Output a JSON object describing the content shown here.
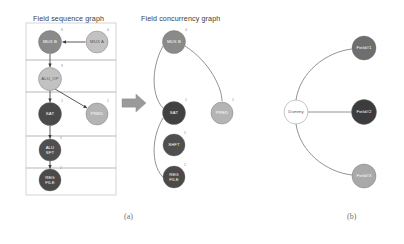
{
  "figure": {
    "panels": [
      {
        "id": "a",
        "caption": "(a)",
        "caption_x": 124,
        "caption_y": 212
      },
      {
        "id": "b",
        "caption": "(b)",
        "caption_x": 347,
        "caption_y": 212
      }
    ]
  },
  "sequence_graph": {
    "title": "Field sequence graph",
    "title_x": 33,
    "title_y": 14,
    "frame": {
      "x": 26,
      "y": 23,
      "width": 90,
      "height": 172
    },
    "bands": [
      {
        "name": "band-1",
        "y": 23,
        "height": 37
      },
      {
        "name": "band-2",
        "y": 60,
        "height": 32
      },
      {
        "name": "band-3",
        "y": 92,
        "height": 44
      },
      {
        "name": "band-4",
        "y": 136,
        "height": 32
      },
      {
        "name": "band-5",
        "y": 168,
        "height": 27
      }
    ],
    "nodes": [
      {
        "id": "mux-b",
        "label": "MUX B",
        "lines": [
          "MUX B"
        ],
        "cx": 50,
        "cy": 42,
        "r": 11.5,
        "fill": "#8a8a8a",
        "label_style": "light",
        "sup": "6",
        "sup_x": 62,
        "sup_y": 31
      },
      {
        "id": "mux-a",
        "label": "MUX A",
        "lines": [
          "MUX A"
        ],
        "cx": 97,
        "cy": 42,
        "r": 11,
        "fill": "#c2c2c2",
        "label_style": "dark",
        "sup": "4",
        "sup_x": 108,
        "sup_y": 31
      },
      {
        "id": "alu-op",
        "label": "ALU_OP",
        "lines": [
          "ALU_OP"
        ],
        "cx": 50,
        "cy": 79,
        "r": 11.5,
        "fill": "#c2c2c2",
        "label_style": "dark",
        "sup": "9",
        "sup_x": 62,
        "sup_y": 67
      },
      {
        "id": "sat",
        "label": "SAT",
        "lines": [
          "SAT"
        ],
        "cx": 50,
        "cy": 114,
        "r": 11.5,
        "fill": "#4a4a4a",
        "label_style": "light",
        "sup": "1",
        "sup_x": 62,
        "sup_y": 102
      },
      {
        "id": "pred",
        "label": "PRED",
        "lines": [
          "PRED"
        ],
        "cx": 97,
        "cy": 114,
        "r": 11,
        "fill": "#b4b4b4",
        "label_style": "light",
        "sup": "1",
        "sup_x": 108,
        "sup_y": 102
      },
      {
        "id": "alu-sft",
        "label": "ALU SFT",
        "lines": [
          "ALU",
          "SFT"
        ],
        "cx": 50,
        "cy": 150,
        "r": 11,
        "fill": "#4f4f4f",
        "label_style": "light",
        "sup": "5",
        "sup_x": 61,
        "sup_y": 139
      },
      {
        "id": "reg-file",
        "label": "REG FILE",
        "lines": [
          "REG",
          "FILE"
        ],
        "cx": 50,
        "cy": 180,
        "r": 11,
        "fill": "#4a4a4a",
        "label_style": "light",
        "sup": "2",
        "sup_x": 61,
        "sup_y": 169
      }
    ],
    "edges": [
      {
        "from": "mux-a",
        "to": "mux-b",
        "path": "M 85.5,42 L 62.5,42"
      },
      {
        "from": "mux-b",
        "to": "alu-op",
        "path": "M 50,53.5 L 50,67"
      },
      {
        "from": "alu-op",
        "to": "sat",
        "path": "M 50,90.5 L 50,102"
      },
      {
        "from": "alu-op",
        "to": "pred",
        "path": "M 55,89 L 87,108"
      },
      {
        "from": "sat",
        "to": "alu-sft",
        "path": "M 50,125.5 L 50,138.5"
      },
      {
        "from": "alu-sft",
        "to": "reg-file",
        "path": "M 50,161 L 50,168.5"
      }
    ]
  },
  "transform_arrow": {
    "name": "transform-arrow",
    "x": 122,
    "y": 94,
    "width": 24,
    "height": 18,
    "fill": "#9a9a9a"
  },
  "concurrency_graph": {
    "title": "Field concurrency graph",
    "title_x": 141,
    "title_y": 14,
    "nodes": [
      {
        "id": "c-mux-b",
        "label": "MUX B",
        "lines": [
          "MUX B"
        ],
        "cx": 174,
        "cy": 42,
        "r": 11.5,
        "fill": "#8a8a8a",
        "label_style": "light",
        "sup": "4",
        "sup_x": 186,
        "sup_y": 31
      },
      {
        "id": "c-sat",
        "label": "SAT",
        "lines": [
          "SAT"
        ],
        "cx": 174,
        "cy": 113,
        "r": 11.5,
        "fill": "#414141",
        "label_style": "light",
        "sup": "1",
        "sup_x": 186,
        "sup_y": 101
      },
      {
        "id": "c-pred",
        "label": "PRED",
        "lines": [
          "PRED"
        ],
        "cx": 222,
        "cy": 113,
        "r": 11,
        "fill": "#b4b4b4",
        "label_style": "light",
        "sup": "1",
        "sup_x": 233,
        "sup_y": 101
      },
      {
        "id": "c-shft",
        "label": "SHFT",
        "lines": [
          "SHFT"
        ],
        "cx": 174,
        "cy": 145,
        "r": 11,
        "fill": "#4f4f4f",
        "label_style": "light",
        "sup": "5",
        "sup_x": 185,
        "sup_y": 134
      },
      {
        "id": "c-reg-file",
        "label": "REG FILE",
        "lines": [
          "REG",
          "FILE"
        ],
        "cx": 174,
        "cy": 177,
        "r": 11,
        "fill": "#4a4a4a",
        "label_style": "light",
        "sup": "2",
        "sup_x": 185,
        "sup_y": 166
      }
    ],
    "edges": [
      {
        "from": "c-mux-b",
        "to": "c-sat",
        "path": "M 163,46 C 150,70 152,98 164,109"
      },
      {
        "from": "c-mux-b",
        "to": "c-pred",
        "path": "M 185,46 C 210,62 222,88 222,101"
      },
      {
        "from": "c-sat",
        "to": "c-reg-file",
        "path": "M 163,118 C 150,140 152,168 164,178"
      }
    ]
  },
  "dummy_graph": {
    "nodes": [
      {
        "id": "dummy",
        "label": "Dummy",
        "cx": 296,
        "cy": 112,
        "r": 12,
        "fill": "#ffffff",
        "label_style": "outline"
      },
      {
        "id": "field1",
        "label": "Field#1",
        "cx": 364,
        "cy": 48,
        "r": 12,
        "fill": "#6e6e6e",
        "label_style": "light"
      },
      {
        "id": "field2",
        "label": "Field#2",
        "cx": 364,
        "cy": 112,
        "r": 12.5,
        "fill": "#3c3c3c",
        "label_style": "light"
      },
      {
        "id": "field3",
        "label": "Field#3",
        "cx": 364,
        "cy": 176,
        "r": 12,
        "fill": "#a9a9a9",
        "label_style": "light"
      }
    ],
    "edges": [
      {
        "from": "dummy",
        "to": "field1",
        "path": "M 296,100 C 300,72 326,52 352,49"
      },
      {
        "from": "dummy",
        "to": "field2",
        "path": "M 308,112 L 351.5,112"
      },
      {
        "from": "dummy",
        "to": "field3",
        "path": "M 296,124 C 300,152 326,172 352,175"
      }
    ]
  }
}
